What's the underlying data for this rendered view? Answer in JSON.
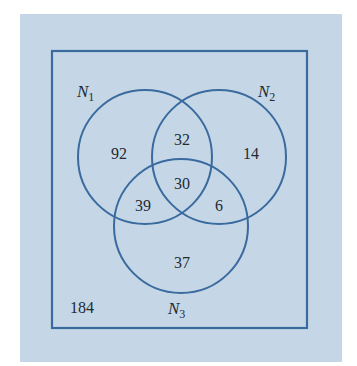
{
  "diagram": {
    "type": "venn",
    "colors": {
      "background": "#c5d7e6",
      "stroke": "#3a6a9e",
      "text": "#222a33"
    },
    "sets": [
      {
        "name": "N",
        "sub": "1"
      },
      {
        "name": "N",
        "sub": "2"
      },
      {
        "name": "N",
        "sub": "3"
      }
    ],
    "regions": {
      "only_n1": "92",
      "only_n2": "14",
      "only_n3": "37",
      "n1_n2": "32",
      "n1_n3": "39",
      "n2_n3": "6",
      "n1_n2_n3": "30",
      "outside": "184"
    }
  }
}
